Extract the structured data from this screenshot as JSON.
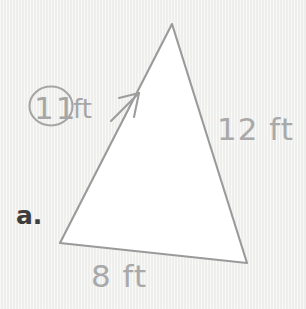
{
  "figure": {
    "problem_label": "a.",
    "shape": "triangle",
    "background_color": "#f1f1ef",
    "fill_color": "#ffffff",
    "stroke_color": "#9a9a9a",
    "label_color": "#a9a9a9",
    "problem_label_color": "#3d3d3d",
    "vertices": {
      "apex": [
        172,
        24
      ],
      "bottom_left": [
        60,
        243
      ],
      "bottom_right": [
        247,
        263
      ]
    },
    "sides": [
      {
        "name": "left-side",
        "length_value": "11",
        "unit": "ft",
        "label": "11 ft",
        "circled": true
      },
      {
        "name": "right-side",
        "length_value": "12",
        "unit": "ft",
        "label": "12 ft",
        "circled": false
      },
      {
        "name": "base",
        "length_value": "8",
        "unit": "ft",
        "label": "8 ft",
        "circled": false
      }
    ],
    "circled_measure": {
      "digits": "11",
      "unit": "ft",
      "circle_center": [
        51,
        106
      ],
      "circle_rx": 21,
      "circle_ry": 19
    },
    "arrow": {
      "name": "pointer-arrow",
      "from": [
        112,
        120
      ],
      "to": [
        139,
        94
      ]
    },
    "labels": {
      "left": "11",
      "left_unit": "ft",
      "right": "12 ft",
      "base": "8 ft"
    }
  }
}
